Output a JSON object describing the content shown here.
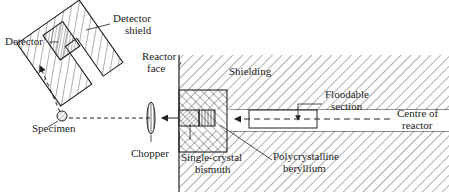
{
  "figure": {
    "type": "neutron spectrometer schematic",
    "colors": {
      "ink": "#2a2a2a",
      "background": "#ffffff"
    }
  },
  "labels": {
    "detector": "Detector",
    "detector_shield_1": "Detector",
    "detector_shield_2": "shield",
    "reactor_face_1": "Reactor",
    "reactor_face_2": "face",
    "shielding": "Shielding",
    "floodable_1": "Floodable",
    "floodable_2": "section",
    "centre_1": "Centre of",
    "centre_2": "reactor",
    "specimen": "Specimen",
    "chopper": "Chopper",
    "bismuth_1": "Single-crystal",
    "bismuth_2": "bismuth",
    "beryllium_1": "Polycrystalline",
    "beryllium_2": "beryllium"
  }
}
